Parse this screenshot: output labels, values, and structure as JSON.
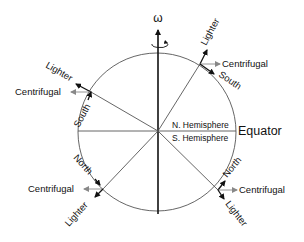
{
  "diagram": {
    "axis_label": "ω",
    "equator_label": "Equator",
    "north_hemisphere": "N. Hemisphere",
    "south_hemisphere": "S. Hemisphere",
    "upper_right": {
      "lighter": "Lighter",
      "centrifugal": "Centrifugal",
      "direction": "South"
    },
    "upper_left": {
      "lighter": "Lighter",
      "centrifugal": "Centrifugal",
      "direction": "South"
    },
    "lower_left": {
      "lighter": "Lighter",
      "centrifugal": "Centrifugal",
      "direction": "North"
    },
    "lower_right": {
      "lighter": "Lighter",
      "centrifugal": "Centrifugal",
      "direction": "North"
    },
    "colors": {
      "line": "#333333",
      "arrow_black": "#111111",
      "centrifugal_arrow": "#888888"
    }
  }
}
